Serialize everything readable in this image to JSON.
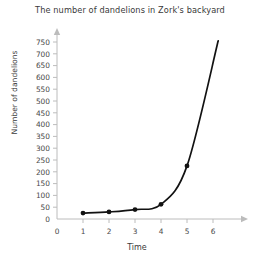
{
  "chart_data": {
    "type": "line",
    "title": "The number of dandelions in Zork's backyard",
    "xlabel": "Time",
    "ylabel": "Number of dandelions",
    "x": [
      1,
      2,
      3,
      4,
      5,
      6.2
    ],
    "values": [
      25,
      30,
      40,
      62,
      225,
      755
    ],
    "series": [
      {
        "name": "dandelions",
        "x": [
          1,
          2,
          3,
          4,
          5,
          6.2
        ],
        "values": [
          25,
          30,
          40,
          62,
          225,
          755
        ]
      }
    ],
    "xlim": [
      0,
      6.6
    ],
    "ylim": [
      0,
      790
    ],
    "xticks": [
      0,
      1,
      2,
      3,
      4,
      5,
      6
    ],
    "yticks": [
      0,
      50,
      100,
      150,
      200,
      250,
      300,
      350,
      400,
      450,
      500,
      550,
      600,
      650,
      700,
      750
    ],
    "xtick_labels": [
      "0",
      "1",
      "2",
      "3",
      "4",
      "5",
      "6"
    ],
    "ytick_labels": [
      "0",
      "50",
      "100",
      "150",
      "200",
      "250",
      "300",
      "350",
      "400",
      "450",
      "500",
      "550",
      "600",
      "650",
      "700",
      "750"
    ],
    "grid": false,
    "legend": false,
    "marker": "circle",
    "line_color": "#121212",
    "axis_color": "#bcbcbc",
    "text_color": "#3a3a3a",
    "background": "#ffffff"
  }
}
